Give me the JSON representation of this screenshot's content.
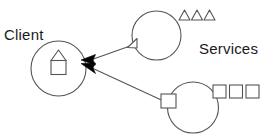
{
  "diagram": {
    "type": "component-service-dependency-diagram",
    "background_color": "#ffffff",
    "stroke_color": "#555555",
    "arrow_fill_color": "#000000",
    "text_color": "#1a1a1a",
    "labels": {
      "client": "Client",
      "services": "Services"
    },
    "nodes": [
      {
        "id": "client-node",
        "name": "client-circle",
        "shape": "circle",
        "cx": 58.5,
        "cy": 68.5,
        "r": 27.5,
        "inner_symbol": "house-shape",
        "inner_symbol_desc": "triangle above square"
      },
      {
        "id": "service-top-node",
        "name": "top-service-circle",
        "shape": "circle",
        "cx": 156.5,
        "cy": 35.5,
        "r": 24.5,
        "port_symbol": "triangle",
        "port_x": 132,
        "port_y": 42.5
      },
      {
        "id": "service-bottom-node",
        "name": "bottom-service-circle",
        "shape": "circle",
        "cx": 193,
        "cy": 107.5,
        "r": 25.5,
        "port_symbol": "square",
        "port_x": 167.5,
        "port_y": 100
      }
    ],
    "connectors": [
      {
        "id": "arrow-top",
        "name": "dependency-arrow-top-service-to-client",
        "from": "service-top-node",
        "to": "client-node",
        "x1": 131.5,
        "y1": 45.5,
        "x2": 95,
        "y2": 59.5,
        "arrowhead": "solid-filled"
      },
      {
        "id": "arrow-bottom",
        "name": "dependency-arrow-bottom-service-to-client",
        "from": "service-bottom-node",
        "to": "client-node",
        "x1": 163.5,
        "y1": 101,
        "x2": 95,
        "y2": 68.5,
        "arrowhead": "solid-filled"
      }
    ],
    "legend_triangles": {
      "name": "triangle-interface-row",
      "count": 3,
      "items": [
        {
          "x": 179,
          "y": 10,
          "w": 11,
          "h": 10
        },
        {
          "x": 191.5,
          "y": 10,
          "w": 11,
          "h": 10
        },
        {
          "x": 204,
          "y": 10,
          "w": 11,
          "h": 10
        }
      ]
    },
    "legend_squares": {
      "name": "square-interface-row",
      "count": 3,
      "items": [
        {
          "x": 213,
          "y": 85,
          "w": 13,
          "h": 13
        },
        {
          "x": 229.5,
          "y": 85,
          "w": 13,
          "h": 13
        },
        {
          "x": 246,
          "y": 85,
          "w": 13,
          "h": 13
        }
      ]
    }
  }
}
